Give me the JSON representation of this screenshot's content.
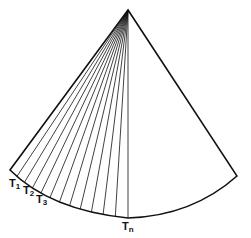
{
  "diagram": {
    "type": "fan-sector",
    "apex": [
      128,
      10
    ],
    "left_corner": [
      10,
      170
    ],
    "right_corner": [
      237,
      176
    ],
    "arc_bottom": [
      128,
      218
    ],
    "fan_line_count": 12,
    "stroke_color": "#111111",
    "labels": [
      {
        "id": "t1",
        "base": "T",
        "sub": "1",
        "x": 9,
        "y": 178
      },
      {
        "id": "t2",
        "base": "T",
        "sub": "2",
        "x": 23,
        "y": 185
      },
      {
        "id": "t3",
        "base": "T",
        "sub": "3",
        "x": 36,
        "y": 194
      },
      {
        "id": "tn",
        "base": "T",
        "sub": "n",
        "x": 122,
        "y": 221
      }
    ]
  }
}
